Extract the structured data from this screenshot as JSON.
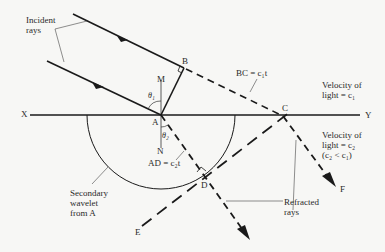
{
  "diagram": {
    "colors": {
      "ink": "#1a1a1a",
      "background": "#f7f7f5"
    },
    "points": {
      "X": "X",
      "Y": "Y",
      "A": "A",
      "B": "B",
      "C": "C",
      "D": "D",
      "E": "E",
      "F": "F",
      "M": "M",
      "N": "N"
    },
    "angles": {
      "incidence": "θ₁",
      "refraction": "θ₂"
    },
    "labels": {
      "incident_rays_line1": "Incident",
      "incident_rays_line2": "rays",
      "bc": "BC = c₁t",
      "ad": "AD = c₂t",
      "velocity1_line1": "Velocity of",
      "velocity1_line2": "light = c₁",
      "velocity2_line1": "Velocity of",
      "velocity2_line2": "light = c₂",
      "velocity2_line3": "(c₂ < c₁)",
      "wavelet_line1": "Secondary",
      "wavelet_line2": "wavelet",
      "wavelet_line3": "from A",
      "refracted_line1": "Refracted",
      "refracted_line2": "rays"
    }
  }
}
